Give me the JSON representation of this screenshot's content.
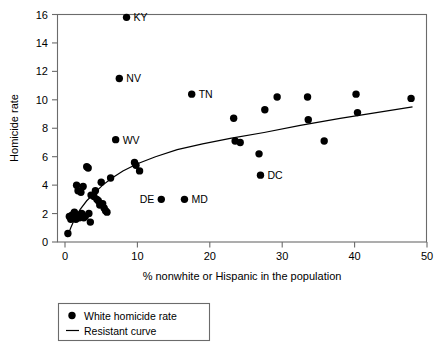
{
  "chart_data": {
    "type": "scatter",
    "title": "",
    "xlabel": "% nonwhite or Hispanic in the population",
    "ylabel": "Homicide rate",
    "xlim": [
      0,
      50
    ],
    "ylim": [
      0,
      16
    ],
    "xticks": [
      0,
      10,
      20,
      30,
      40,
      50
    ],
    "yticks": [
      0,
      2,
      4,
      6,
      8,
      10,
      12,
      14,
      16
    ],
    "grid": false,
    "legend_position": "below-left",
    "series": [
      {
        "name": "White homicide rate",
        "marker": "filled-circle",
        "color": "#000000",
        "points": [
          {
            "x": 0.4,
            "y": 0.6,
            "label": ""
          },
          {
            "x": 0.6,
            "y": 1.8,
            "label": ""
          },
          {
            "x": 0.8,
            "y": 1.6,
            "label": ""
          },
          {
            "x": 1.0,
            "y": 1.9,
            "label": ""
          },
          {
            "x": 1.2,
            "y": 1.7,
            "label": ""
          },
          {
            "x": 1.3,
            "y": 2.1,
            "label": ""
          },
          {
            "x": 1.5,
            "y": 1.6,
            "label": ""
          },
          {
            "x": 1.6,
            "y": 4.0,
            "label": ""
          },
          {
            "x": 1.8,
            "y": 3.6,
            "label": ""
          },
          {
            "x": 1.9,
            "y": 1.8,
            "label": ""
          },
          {
            "x": 2.0,
            "y": 1.7,
            "label": ""
          },
          {
            "x": 2.2,
            "y": 3.5,
            "label": ""
          },
          {
            "x": 2.3,
            "y": 2.0,
            "label": ""
          },
          {
            "x": 2.4,
            "y": 1.9,
            "label": ""
          },
          {
            "x": 2.5,
            "y": 3.9,
            "label": ""
          },
          {
            "x": 2.6,
            "y": 1.7,
            "label": ""
          },
          {
            "x": 2.8,
            "y": 1.8,
            "label": ""
          },
          {
            "x": 3.0,
            "y": 5.3,
            "label": ""
          },
          {
            "x": 3.2,
            "y": 5.2,
            "label": ""
          },
          {
            "x": 3.3,
            "y": 2.0,
            "label": ""
          },
          {
            "x": 3.5,
            "y": 1.4,
            "label": ""
          },
          {
            "x": 3.6,
            "y": 3.3,
            "label": ""
          },
          {
            "x": 4.0,
            "y": 3.2,
            "label": ""
          },
          {
            "x": 4.2,
            "y": 3.6,
            "label": ""
          },
          {
            "x": 4.4,
            "y": 3.0,
            "label": ""
          },
          {
            "x": 4.6,
            "y": 2.9,
            "label": ""
          },
          {
            "x": 4.8,
            "y": 2.6,
            "label": ""
          },
          {
            "x": 5.0,
            "y": 4.2,
            "label": ""
          },
          {
            "x": 5.2,
            "y": 2.7,
            "label": ""
          },
          {
            "x": 5.4,
            "y": 2.4,
            "label": ""
          },
          {
            "x": 5.6,
            "y": 2.2,
            "label": ""
          },
          {
            "x": 5.8,
            "y": 2.1,
            "label": ""
          },
          {
            "x": 6.3,
            "y": 4.5,
            "label": ""
          },
          {
            "x": 7.0,
            "y": 7.2,
            "label": "WV"
          },
          {
            "x": 7.5,
            "y": 11.5,
            "label": "NV"
          },
          {
            "x": 8.5,
            "y": 15.8,
            "label": "KY"
          },
          {
            "x": 9.6,
            "y": 5.6,
            "label": ""
          },
          {
            "x": 9.8,
            "y": 5.4,
            "label": ""
          },
          {
            "x": 10.3,
            "y": 5.0,
            "label": ""
          },
          {
            "x": 13.3,
            "y": 3.0,
            "label": "DE"
          },
          {
            "x": 16.5,
            "y": 3.0,
            "label": "MD"
          },
          {
            "x": 17.5,
            "y": 10.4,
            "label": "TN"
          },
          {
            "x": 23.3,
            "y": 8.7,
            "label": ""
          },
          {
            "x": 23.5,
            "y": 7.1,
            "label": ""
          },
          {
            "x": 24.2,
            "y": 7.0,
            "label": ""
          },
          {
            "x": 26.8,
            "y": 6.2,
            "label": ""
          },
          {
            "x": 27.0,
            "y": 4.7,
            "label": "DC"
          },
          {
            "x": 27.6,
            "y": 9.3,
            "label": ""
          },
          {
            "x": 29.3,
            "y": 10.2,
            "label": ""
          },
          {
            "x": 33.5,
            "y": 10.2,
            "label": ""
          },
          {
            "x": 33.6,
            "y": 8.6,
            "label": ""
          },
          {
            "x": 35.8,
            "y": 7.1,
            "label": ""
          },
          {
            "x": 40.2,
            "y": 10.4,
            "label": ""
          },
          {
            "x": 40.4,
            "y": 9.1,
            "label": ""
          },
          {
            "x": 47.8,
            "y": 10.1,
            "label": ""
          }
        ]
      }
    ],
    "fit_curve": {
      "name": "Resistant curve",
      "color": "#000000",
      "points": [
        {
          "x": 0.3,
          "y": 0.35
        },
        {
          "x": 0.8,
          "y": 1.0
        },
        {
          "x": 1.4,
          "y": 1.7
        },
        {
          "x": 2.1,
          "y": 2.3
        },
        {
          "x": 3.0,
          "y": 2.9
        },
        {
          "x": 4.0,
          "y": 3.4
        },
        {
          "x": 5.2,
          "y": 4.0
        },
        {
          "x": 6.5,
          "y": 4.5
        },
        {
          "x": 8.0,
          "y": 5.0
        },
        {
          "x": 10.0,
          "y": 5.5
        },
        {
          "x": 12.5,
          "y": 6.0
        },
        {
          "x": 15.5,
          "y": 6.5
        },
        {
          "x": 19.0,
          "y": 6.9
        },
        {
          "x": 23.0,
          "y": 7.3
        },
        {
          "x": 27.5,
          "y": 7.7
        },
        {
          "x": 32.5,
          "y": 8.2
        },
        {
          "x": 38.0,
          "y": 8.7
        },
        {
          "x": 43.0,
          "y": 9.1
        },
        {
          "x": 48.0,
          "y": 9.5
        }
      ]
    },
    "legend": [
      {
        "marker": "filled-circle",
        "label": "White homicide rate"
      },
      {
        "marker": "line",
        "label": "Resistant curve"
      }
    ]
  }
}
